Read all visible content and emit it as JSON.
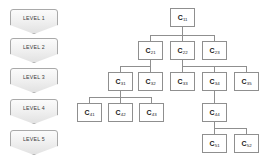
{
  "diagram": {
    "node_prefix": "C",
    "colors": {
      "background": "#ffffff",
      "node_border": "#8f8f8f",
      "node_fill": "#ffffff",
      "edge": "#8f8f8f",
      "banner_border": "#a9a9a9",
      "banner_fill": "#f1f1f1",
      "text": "#1a1a1a"
    }
  },
  "levels": [
    {
      "label": "LEVEL 1",
      "index": 1
    },
    {
      "label": "LEVEL 2",
      "index": 2
    },
    {
      "label": "LEVEL 3",
      "index": 3
    },
    {
      "label": "LEVEL 4",
      "index": 4
    },
    {
      "label": "LEVEL 5",
      "index": 5
    }
  ],
  "nodes": [
    {
      "id": "C11",
      "base": "C",
      "sub": "11",
      "level": 1,
      "parent": null
    },
    {
      "id": "C21",
      "base": "C",
      "sub": "21",
      "level": 2,
      "parent": "C11"
    },
    {
      "id": "C22",
      "base": "C",
      "sub": "22",
      "level": 2,
      "parent": "C11"
    },
    {
      "id": "C23",
      "base": "C",
      "sub": "23",
      "level": 2,
      "parent": "C11"
    },
    {
      "id": "C31",
      "base": "C",
      "sub": "31",
      "level": 3,
      "parent": "C21"
    },
    {
      "id": "C32",
      "base": "C",
      "sub": "32",
      "level": 3,
      "parent": "C21"
    },
    {
      "id": "C33",
      "base": "C",
      "sub": "33",
      "level": 3,
      "parent": "C22"
    },
    {
      "id": "C34",
      "base": "C",
      "sub": "34",
      "level": 3,
      "parent": "C22"
    },
    {
      "id": "C35",
      "base": "C",
      "sub": "35",
      "level": 3,
      "parent": "C22"
    },
    {
      "id": "C41",
      "base": "C",
      "sub": "41",
      "level": 4,
      "parent": "C31"
    },
    {
      "id": "C42",
      "base": "C",
      "sub": "42",
      "level": 4,
      "parent": "C31"
    },
    {
      "id": "C43",
      "base": "C",
      "sub": "43",
      "level": 4,
      "parent": "C31"
    },
    {
      "id": "C44",
      "base": "C",
      "sub": "44",
      "level": 4,
      "parent": "C34"
    },
    {
      "id": "C51",
      "base": "C",
      "sub": "51",
      "level": 5,
      "parent": "C44"
    },
    {
      "id": "C52",
      "base": "C",
      "sub": "52",
      "level": 5,
      "parent": "C44"
    }
  ]
}
